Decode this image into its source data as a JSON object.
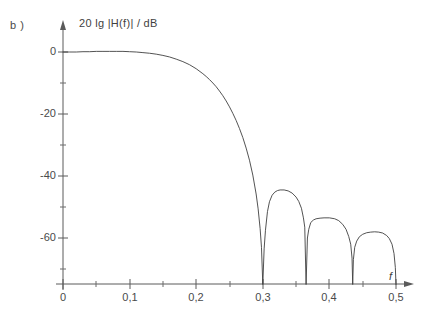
{
  "figure": {
    "panel_label": "b )",
    "y_axis_label": "20 lg |H(f)| / dB",
    "x_axis_label": "f"
  },
  "chart_data": {
    "type": "line",
    "title": "",
    "subtitle": "",
    "xlabel": "f",
    "ylabel": "20 lg |H(f)| / dB",
    "xlim": [
      0,
      0.52
    ],
    "ylim": [
      -75,
      4
    ],
    "xtick_labels": [
      "0",
      "0,1",
      "0,2",
      "0,3",
      "0,4",
      "0,5"
    ],
    "xticks": [
      0,
      0.1,
      0.2,
      0.3,
      0.4,
      0.5
    ],
    "x_minor_ticks": [
      0.05,
      0.15,
      0.25,
      0.35,
      0.45
    ],
    "ytick_labels": [
      "0",
      "-20",
      "-40",
      "-60"
    ],
    "yticks": [
      0,
      -20,
      -40,
      -60
    ],
    "y_minor_ticks": [
      -10,
      -30,
      -50,
      -70
    ],
    "grid": false,
    "legend_position": "none",
    "axis_style": "arrow-axes-open",
    "line_color": "#404040",
    "line_width": 0.9,
    "nulls": [
      0.3,
      0.365,
      0.435,
      0.5
    ],
    "sidelobe_peaks": [
      {
        "x": 0.332,
        "y": -44.5
      },
      {
        "x": 0.4,
        "y": -53.5
      },
      {
        "x": 0.468,
        "y": -58.0
      }
    ],
    "annotations": [
      "b )"
    ],
    "series": [
      {
        "name": "20 lg |H(f)|",
        "x": [
          0.0,
          0.01,
          0.02,
          0.03,
          0.04,
          0.05,
          0.06,
          0.07,
          0.08,
          0.09,
          0.1,
          0.11,
          0.12,
          0.13,
          0.14,
          0.15,
          0.16,
          0.17,
          0.18,
          0.19,
          0.2,
          0.21,
          0.215,
          0.22,
          0.225,
          0.23,
          0.235,
          0.24,
          0.245,
          0.25,
          0.255,
          0.26,
          0.265,
          0.27,
          0.275,
          0.28,
          0.285,
          0.29,
          0.293,
          0.296,
          0.298,
          0.3,
          0.302,
          0.304,
          0.307,
          0.31,
          0.314,
          0.318,
          0.322,
          0.326,
          0.332,
          0.338,
          0.344,
          0.35,
          0.354,
          0.358,
          0.361,
          0.363,
          0.365,
          0.367,
          0.369,
          0.372,
          0.376,
          0.38,
          0.386,
          0.392,
          0.4,
          0.408,
          0.414,
          0.42,
          0.425,
          0.429,
          0.432,
          0.434,
          0.435,
          0.436,
          0.438,
          0.441,
          0.445,
          0.45,
          0.456,
          0.462,
          0.468,
          0.474,
          0.48,
          0.486,
          0.49,
          0.494,
          0.497,
          0.499,
          0.5
        ],
        "y": [
          0.0,
          0.0,
          0.0,
          0.1,
          0.1,
          0.2,
          0.2,
          0.2,
          0.2,
          0.2,
          0.1,
          0.0,
          -0.2,
          -0.4,
          -0.7,
          -1.1,
          -1.6,
          -2.3,
          -3.1,
          -4.1,
          -5.4,
          -7.0,
          -7.9,
          -8.9,
          -10.0,
          -11.2,
          -12.6,
          -14.1,
          -15.8,
          -17.7,
          -19.8,
          -22.1,
          -24.7,
          -27.6,
          -31.0,
          -34.9,
          -39.7,
          -45.8,
          -50.6,
          -57.0,
          -63.0,
          -75.0,
          -63.5,
          -57.5,
          -51.5,
          -48.3,
          -46.2,
          -45.2,
          -44.7,
          -44.5,
          -44.5,
          -44.8,
          -45.5,
          -46.8,
          -48.2,
          -50.4,
          -53.5,
          -56.5,
          -75.0,
          -60.0,
          -57.2,
          -55.0,
          -54.2,
          -53.8,
          -53.6,
          -53.5,
          -53.5,
          -53.8,
          -54.4,
          -55.6,
          -57.2,
          -59.5,
          -62.0,
          -66.5,
          -75.0,
          -67.0,
          -63.0,
          -61.0,
          -59.6,
          -58.8,
          -58.3,
          -58.1,
          -58.0,
          -58.1,
          -58.4,
          -59.2,
          -60.2,
          -62.0,
          -65.0,
          -69.5,
          -75.0
        ]
      }
    ]
  }
}
